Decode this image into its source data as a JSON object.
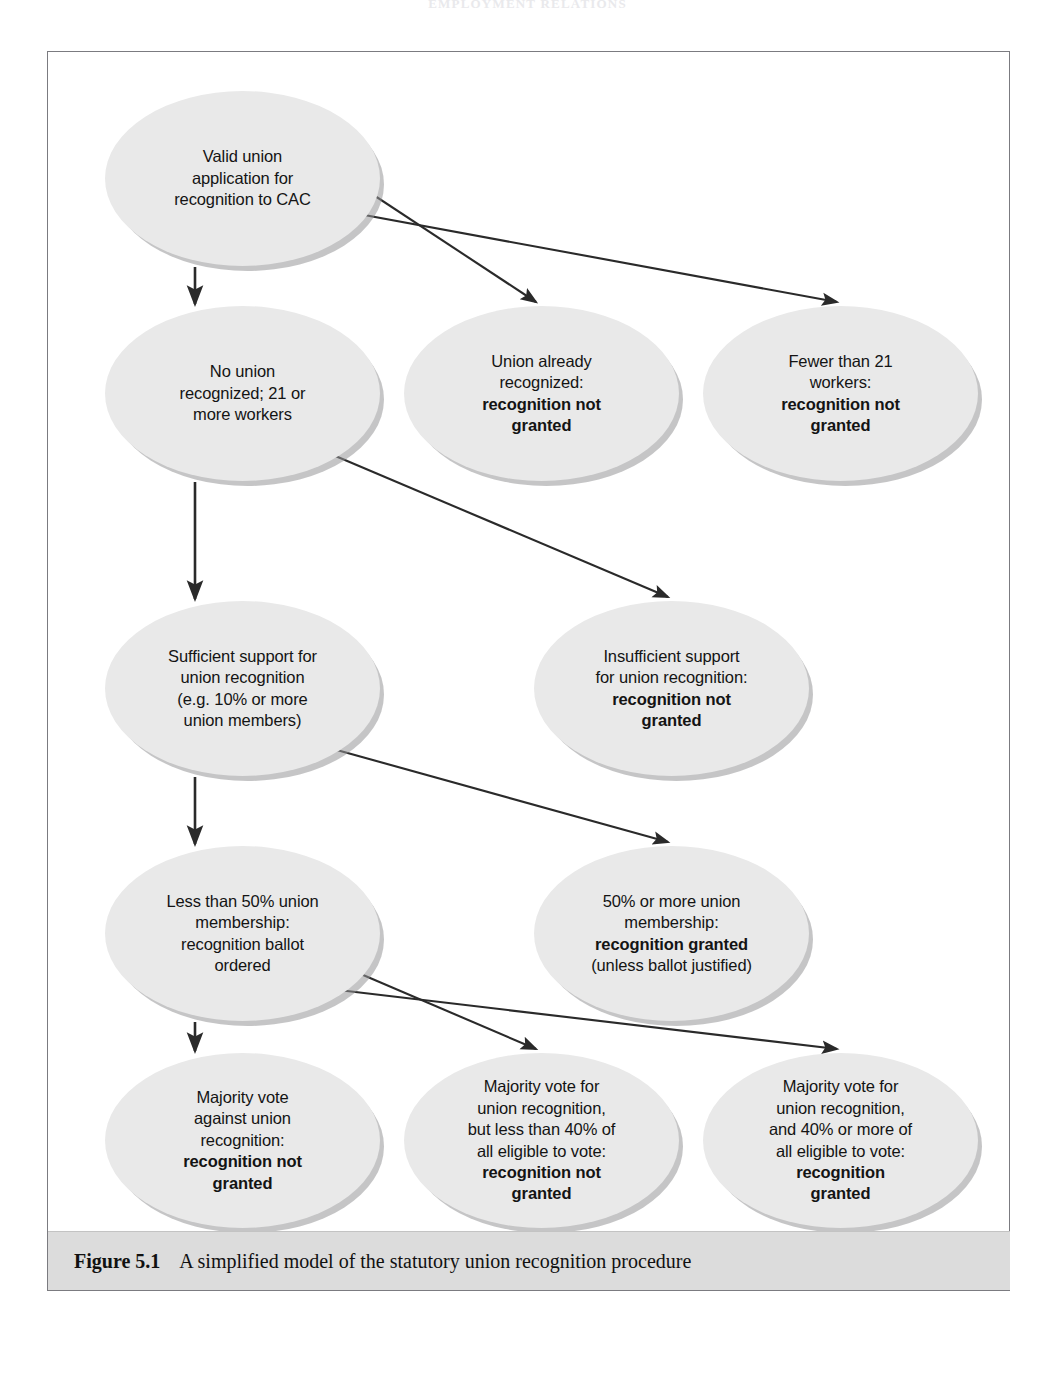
{
  "running_head": "EMPLOYMENT RELATIONS",
  "caption": {
    "label": "Figure 5.1",
    "text": "A simplified model of the statutory union recognition procedure"
  },
  "chart_data": {
    "type": "diagram",
    "title": "A simplified model of the statutory union recognition procedure",
    "nodes": [
      {
        "id": "valid-application",
        "lines": [
          "Valid union",
          "application for",
          "recognition to CAC"
        ],
        "bold_lines": [],
        "x": 57,
        "y": 39,
        "w": 275,
        "h": 175
      },
      {
        "id": "no-union-recognized",
        "lines": [
          "No union",
          "recognized; 21 or",
          "more workers"
        ],
        "bold_lines": [],
        "x": 57,
        "y": 254,
        "w": 275,
        "h": 175
      },
      {
        "id": "union-already-recognized",
        "lines": [
          "Union already",
          "recognized:",
          "recognition not",
          "granted"
        ],
        "bold_lines": [
          2,
          3
        ],
        "x": 356,
        "y": 254,
        "w": 275,
        "h": 175
      },
      {
        "id": "fewer-than-21-workers",
        "lines": [
          "Fewer than 21",
          "workers:",
          "recognition not",
          "granted"
        ],
        "bold_lines": [
          2,
          3
        ],
        "x": 655,
        "y": 254,
        "w": 275,
        "h": 175
      },
      {
        "id": "sufficient-support",
        "lines": [
          "Sufficient support for",
          "union recognition",
          "(e.g. 10% or more",
          "union members)"
        ],
        "bold_lines": [],
        "x": 57,
        "y": 549,
        "w": 275,
        "h": 175
      },
      {
        "id": "insufficient-support",
        "lines": [
          "Insufficient support",
          "for union recognition:",
          "recognition not",
          "granted"
        ],
        "bold_lines": [
          2,
          3
        ],
        "x": 486,
        "y": 549,
        "w": 275,
        "h": 175
      },
      {
        "id": "less-than-50-percent",
        "lines": [
          "Less than 50% union",
          "membership:",
          "recognition ballot",
          "ordered"
        ],
        "bold_lines": [],
        "x": 57,
        "y": 794,
        "w": 275,
        "h": 175
      },
      {
        "id": "fifty-percent-or-more",
        "lines": [
          "50% or more union",
          "membership:",
          "recognition granted",
          "(unless ballot justified)"
        ],
        "bold_lines": [
          2
        ],
        "x": 486,
        "y": 794,
        "w": 275,
        "h": 175
      },
      {
        "id": "majority-against",
        "lines": [
          "Majority vote",
          "against union",
          "recognition:",
          "recognition not",
          "granted"
        ],
        "bold_lines": [
          3,
          4
        ],
        "x": 57,
        "y": 1001,
        "w": 275,
        "h": 175
      },
      {
        "id": "majority-for-under-40",
        "lines": [
          "Majority vote for",
          "union recognition,",
          "but less than 40% of",
          "all eligible to vote:",
          "recognition not",
          "granted"
        ],
        "bold_lines": [
          4,
          5
        ],
        "x": 356,
        "y": 1001,
        "w": 275,
        "h": 175
      },
      {
        "id": "majority-for-over-40",
        "lines": [
          "Majority vote for",
          "union recognition,",
          "and 40% or more of",
          "all eligible to vote:",
          "recognition",
          "granted"
        ],
        "bold_lines": [
          4,
          5
        ],
        "x": 655,
        "y": 1001,
        "w": 275,
        "h": 175
      }
    ],
    "edges": [
      {
        "from": "valid-application",
        "to": "no-union-recognized",
        "kind": "vertical",
        "x1": 147,
        "y1": 215,
        "x2": 147,
        "y2": 252
      },
      {
        "from": "valid-application",
        "to": "union-already-recognized",
        "kind": "diagonal",
        "x1": 280,
        "y1": 113,
        "x2": 488,
        "y2": 250
      },
      {
        "from": "valid-application",
        "to": "fewer-than-21-workers",
        "kind": "diagonal",
        "x1": 300,
        "y1": 160,
        "x2": 789,
        "y2": 250
      },
      {
        "from": "no-union-recognized",
        "to": "sufficient-support",
        "kind": "vertical",
        "x1": 147,
        "y1": 430,
        "x2": 147,
        "y2": 547
      },
      {
        "from": "no-union-recognized",
        "to": "insufficient-support",
        "kind": "diagonal",
        "x1": 278,
        "y1": 400,
        "x2": 620,
        "y2": 545
      },
      {
        "from": "sufficient-support",
        "to": "less-than-50-percent",
        "kind": "vertical",
        "x1": 147,
        "y1": 725,
        "x2": 147,
        "y2": 792
      },
      {
        "from": "sufficient-support",
        "to": "fifty-percent-or-more",
        "kind": "diagonal",
        "x1": 278,
        "y1": 695,
        "x2": 620,
        "y2": 790
      },
      {
        "from": "less-than-50-percent",
        "to": "majority-against",
        "kind": "vertical",
        "x1": 147,
        "y1": 970,
        "x2": 147,
        "y2": 999
      },
      {
        "from": "less-than-50-percent",
        "to": "majority-for-under-40",
        "kind": "diagonal",
        "x1": 273,
        "y1": 905,
        "x2": 488,
        "y2": 997
      },
      {
        "from": "less-than-50-percent",
        "to": "majority-for-over-40",
        "kind": "diagonal",
        "x1": 265,
        "y1": 935,
        "x2": 789,
        "y2": 997
      }
    ],
    "colors": {
      "node_fill": "#e9e9e9",
      "node_shadow": "#969698",
      "arrow": "#2a2a2a",
      "frame_border": "#7b7b80",
      "caption_band": "#dcdcdc",
      "page_background": "#ffffff"
    }
  }
}
